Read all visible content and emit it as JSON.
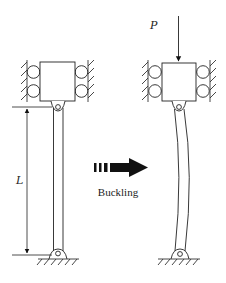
{
  "diagram": {
    "labels": {
      "length": "L",
      "load": "P",
      "transition": "Buckling"
    },
    "colors": {
      "stroke": "#222222",
      "hatch": "#333333",
      "arrow": "#111111",
      "background": "#ffffff"
    },
    "panels": [
      {
        "name": "straight-column",
        "state": "before"
      },
      {
        "name": "buckled-column",
        "state": "after"
      }
    ]
  }
}
